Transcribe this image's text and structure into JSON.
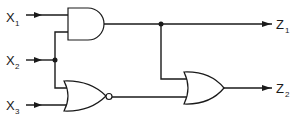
{
  "diagram": {
    "type": "logic-circuit",
    "inputs": [
      {
        "id": "X1",
        "main": "X",
        "sub": "1"
      },
      {
        "id": "X2",
        "main": "X",
        "sub": "2"
      },
      {
        "id": "X3",
        "main": "X",
        "sub": "3"
      }
    ],
    "outputs": [
      {
        "id": "Z1",
        "main": "Z",
        "sub": "1"
      },
      {
        "id": "Z2",
        "main": "Z",
        "sub": "2"
      }
    ],
    "gates": [
      {
        "id": "G1",
        "type": "AND",
        "inputs": [
          "X1",
          "X2"
        ],
        "output": "Z1"
      },
      {
        "id": "G2",
        "type": "NOR",
        "inputs": [
          "X2",
          "X3"
        ],
        "output": "n1"
      },
      {
        "id": "G3",
        "type": "OR",
        "inputs": [
          "Z1",
          "n1"
        ],
        "output": "Z2"
      }
    ],
    "colors": {
      "line": "#1a1a1a",
      "background": "#ffffff"
    }
  }
}
